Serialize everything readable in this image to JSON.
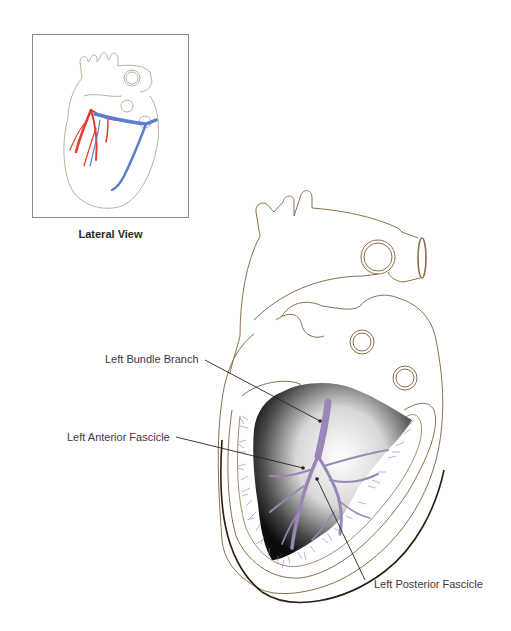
{
  "inset": {
    "caption": "Lateral View",
    "artery_color": "#e8392a",
    "vein_color": "#5b7fcf"
  },
  "main": {
    "labels": {
      "left_bundle_branch": "Left Bundle Branch",
      "left_anterior_fascicle": "Left Anterior Fascicle",
      "left_posterior_fascicle": "Left Posterior Fascicle"
    },
    "colors": {
      "outline": "#8b6f47",
      "conduction": "#9b86b8",
      "purkinje": "#8f7fc4",
      "leader_line": "#222222"
    }
  }
}
